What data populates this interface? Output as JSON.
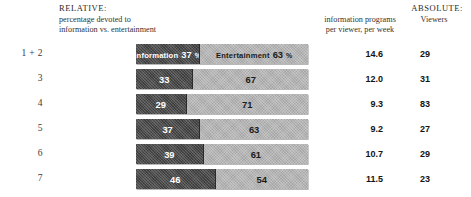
{
  "header": {
    "relative_title": "RELATIVE:",
    "relative_sub_line1": "percentage devoted to",
    "relative_sub_line2": "information vs. entertainment",
    "absolute_title": "ABSOLUTE:",
    "absolute_sub_line1": "information programs",
    "absolute_sub_line2": "per viewer, per week",
    "viewers_label": "Viewers"
  },
  "legend": {
    "information_label": "Information",
    "entertainment_label": "Entertainment",
    "percent_symbol": "%"
  },
  "chart_data": {
    "type": "bar",
    "title": "RELATIVE: percentage devoted to information vs. entertainment",
    "orientation": "horizontal",
    "stacked": true,
    "xlabel": "",
    "ylabel": "",
    "xlim": [
      0,
      100
    ],
    "grid": false,
    "legend_position": "in-bar",
    "categories": [
      "1 + 2",
      "3",
      "4",
      "5",
      "6",
      "7"
    ],
    "series": [
      {
        "name": "Information",
        "values": [
          37,
          33,
          29,
          37,
          39,
          46
        ],
        "color": "#4a4a4a"
      },
      {
        "name": "Entertainment",
        "values": [
          63,
          67,
          71,
          63,
          61,
          54
        ],
        "color": "#b4b4b4"
      }
    ],
    "absolute_columns": [
      {
        "name": "information programs per viewer, per week",
        "values": [
          "14.6",
          "12.0",
          "9.3",
          "9.2",
          "10.7",
          "11.5"
        ]
      },
      {
        "name": "Viewers",
        "values": [
          "29",
          "31",
          "83",
          "27",
          "29",
          "23"
        ]
      }
    ]
  },
  "rows": [
    {
      "label": "1 + 2",
      "info": 37,
      "ent": 63,
      "info_text": "37",
      "ent_text": "63",
      "show_names": true,
      "show_pct": true,
      "per_viewer": "14.6",
      "viewers": "29"
    },
    {
      "label": "3",
      "info": 33,
      "ent": 67,
      "info_text": "33",
      "ent_text": "67",
      "show_names": false,
      "show_pct": false,
      "per_viewer": "12.0",
      "viewers": "31"
    },
    {
      "label": "4",
      "info": 29,
      "ent": 71,
      "info_text": "29",
      "ent_text": "71",
      "show_names": false,
      "show_pct": false,
      "per_viewer": "9.3",
      "viewers": "83"
    },
    {
      "label": "5",
      "info": 37,
      "ent": 63,
      "info_text": "37",
      "ent_text": "63",
      "show_names": false,
      "show_pct": false,
      "per_viewer": "9.2",
      "viewers": "27"
    },
    {
      "label": "6",
      "info": 39,
      "ent": 61,
      "info_text": "39",
      "ent_text": "61",
      "show_names": false,
      "show_pct": false,
      "per_viewer": "10.7",
      "viewers": "29"
    },
    {
      "label": "7",
      "info": 46,
      "ent": 54,
      "info_text": "46",
      "ent_text": "54",
      "show_names": false,
      "show_pct": false,
      "per_viewer": "11.5",
      "viewers": "23"
    }
  ]
}
